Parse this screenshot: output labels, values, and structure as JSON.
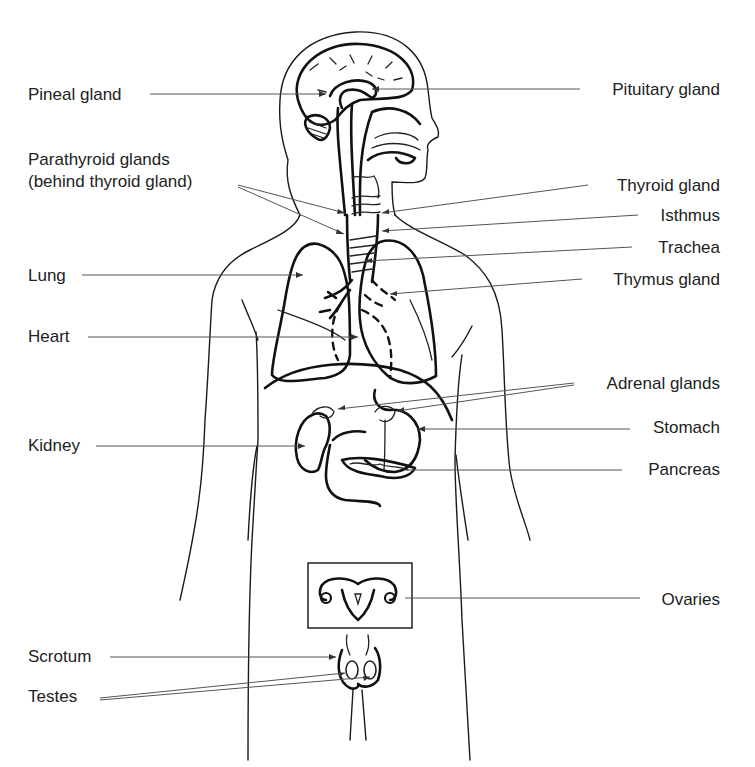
{
  "diagram": {
    "colors": {
      "ink": "#111111",
      "label": "#222222",
      "leader": "#555555",
      "background": "#ffffff"
    },
    "labels_left": [
      {
        "id": "pineal-gland",
        "text": "Pineal gland",
        "x": 28,
        "y": 85
      },
      {
        "id": "parathyroid-glands",
        "text": "Parathyroid glands",
        "x": 28,
        "y": 150
      },
      {
        "id": "parathyroid-note",
        "text": "(behind thyroid gland)",
        "x": 28,
        "y": 172
      },
      {
        "id": "lung",
        "text": "Lung",
        "x": 28,
        "y": 266
      },
      {
        "id": "heart",
        "text": "Heart",
        "x": 28,
        "y": 327
      },
      {
        "id": "kidney",
        "text": "Kidney",
        "x": 28,
        "y": 436
      },
      {
        "id": "scrotum",
        "text": "Scrotum",
        "x": 28,
        "y": 647
      },
      {
        "id": "testes",
        "text": "Testes",
        "x": 28,
        "y": 687
      }
    ],
    "labels_right": [
      {
        "id": "pituitary-gland",
        "text": "Pituitary gland",
        "right": 35,
        "y": 80
      },
      {
        "id": "thyroid-gland",
        "text": "Thyroid gland",
        "right": 35,
        "y": 176
      },
      {
        "id": "isthmus",
        "text": "Isthmus",
        "right": 35,
        "y": 206
      },
      {
        "id": "trachea",
        "text": "Trachea",
        "right": 35,
        "y": 238
      },
      {
        "id": "thymus-gland",
        "text": "Thymus gland",
        "right": 35,
        "y": 270
      },
      {
        "id": "adrenal-glands",
        "text": "Adrenal glands",
        "right": 35,
        "y": 374
      },
      {
        "id": "stomach",
        "text": "Stomach",
        "right": 35,
        "y": 418
      },
      {
        "id": "pancreas",
        "text": "Pancreas",
        "right": 35,
        "y": 460
      },
      {
        "id": "ovaries",
        "text": "Ovaries",
        "right": 35,
        "y": 590
      }
    ],
    "leaders": [
      {
        "for": "pineal-gland",
        "x1": 150,
        "y1": 94,
        "x2": 326,
        "y2": 94
      },
      {
        "for": "pituitary-gland",
        "x1": 580,
        "y1": 89,
        "x2": 372,
        "y2": 89
      },
      {
        "for": "parathyroid-glands",
        "x1": 238,
        "y1": 185,
        "x2": 345,
        "y2": 213
      },
      {
        "for": "parathyroid-glands",
        "x1": 238,
        "y1": 187,
        "x2": 344,
        "y2": 234
      },
      {
        "for": "thyroid-gland",
        "x1": 588,
        "y1": 185,
        "x2": 382,
        "y2": 213
      },
      {
        "for": "isthmus",
        "x1": 638,
        "y1": 215,
        "x2": 382,
        "y2": 231
      },
      {
        "for": "trachea",
        "x1": 632,
        "y1": 247,
        "x2": 365,
        "y2": 261
      },
      {
        "for": "thymus-gland",
        "x1": 582,
        "y1": 279,
        "x2": 390,
        "y2": 294
      },
      {
        "for": "lung",
        "x1": 82,
        "y1": 275,
        "x2": 303,
        "y2": 275
      },
      {
        "for": "heart",
        "x1": 88,
        "y1": 337,
        "x2": 358,
        "y2": 337
      },
      {
        "for": "adrenal-glands",
        "x1": 574,
        "y1": 383,
        "x2": 338,
        "y2": 409
      },
      {
        "for": "adrenal-glands",
        "x1": 574,
        "y1": 385,
        "x2": 397,
        "y2": 411
      },
      {
        "for": "stomach",
        "x1": 630,
        "y1": 429,
        "x2": 418,
        "y2": 429
      },
      {
        "for": "pancreas",
        "x1": 622,
        "y1": 470,
        "x2": 405,
        "y2": 470
      },
      {
        "for": "kidney",
        "x1": 96,
        "y1": 446,
        "x2": 305,
        "y2": 446
      },
      {
        "for": "ovaries",
        "x1": 640,
        "y1": 598,
        "x2": 405,
        "y2": 598
      },
      {
        "for": "scrotum",
        "x1": 110,
        "y1": 657,
        "x2": 336,
        "y2": 657
      },
      {
        "for": "testes",
        "x1": 100,
        "y1": 698,
        "x2": 345,
        "y2": 673
      },
      {
        "for": "testes",
        "x1": 100,
        "y1": 700,
        "x2": 370,
        "y2": 677
      }
    ]
  }
}
